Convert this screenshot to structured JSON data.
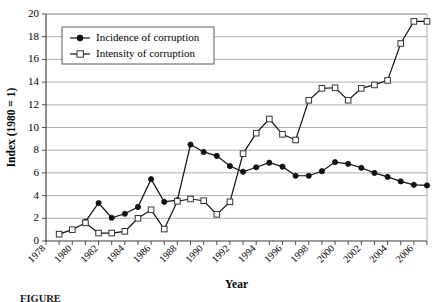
{
  "chart_data": {
    "type": "line",
    "title": "",
    "xlabel": "Year",
    "ylabel": "Index (1980 = 1)",
    "xlim": [
      1978,
      2007
    ],
    "ylim": [
      0,
      20
    ],
    "grid": true,
    "legend_position": "top-left",
    "ytick_labels": [
      "0",
      "2",
      "4",
      "6",
      "8",
      "10",
      "12",
      "14",
      "16",
      "18",
      "20"
    ],
    "ytick_values": [
      0,
      2,
      4,
      6,
      8,
      10,
      12,
      14,
      16,
      18,
      20
    ],
    "xtick_labels": [
      "1978",
      "1980",
      "1982",
      "1984",
      "1986",
      "1988",
      "1990",
      "1992",
      "1994",
      "1996",
      "1998",
      "2000",
      "2002",
      "2004",
      "2006"
    ],
    "xtick_values": [
      1978,
      1980,
      1982,
      1984,
      1986,
      1988,
      1990,
      1992,
      1994,
      1996,
      1998,
      2000,
      2002,
      2004,
      2006
    ],
    "series": [
      {
        "name": "Incidence of corruption",
        "marker": "filled-circle",
        "x": [
          1981,
          1982,
          1983,
          1984,
          1985,
          1986,
          1987,
          1988,
          1989,
          1990,
          1991,
          1992,
          1993,
          1994,
          1995,
          1996,
          1997,
          1998,
          1999,
          2000,
          2001,
          2002,
          2003,
          2004,
          2005,
          2006,
          2007
        ],
        "values": [
          1.7,
          3.35,
          2.05,
          2.4,
          3.0,
          5.45,
          3.45,
          3.6,
          8.5,
          7.85,
          7.5,
          6.6,
          6.1,
          6.5,
          6.9,
          6.55,
          5.75,
          5.75,
          6.15,
          6.95,
          6.8,
          6.45,
          6.0,
          5.65,
          5.25,
          4.95,
          4.9
        ]
      },
      {
        "name": "Intensity of corruption",
        "marker": "open-square",
        "x": [
          1979,
          1980,
          1981,
          1982,
          1983,
          1984,
          1985,
          1986,
          1987,
          1988,
          1989,
          1990,
          1991,
          1992,
          1993,
          1994,
          1995,
          1996,
          1997,
          1998,
          1999,
          2000,
          2001,
          2002,
          2003,
          2004,
          2005,
          2006,
          2007
        ],
        "values": [
          0.6,
          1.0,
          1.6,
          0.7,
          0.7,
          0.85,
          2.0,
          2.75,
          1.05,
          3.5,
          3.7,
          3.55,
          2.35,
          3.45,
          7.7,
          9.5,
          10.75,
          9.4,
          8.9,
          12.4,
          13.45,
          13.5,
          12.4,
          13.45,
          13.75,
          14.15,
          17.4,
          19.35,
          19.35
        ]
      }
    ]
  },
  "caption": {
    "label": "FIGURE"
  }
}
